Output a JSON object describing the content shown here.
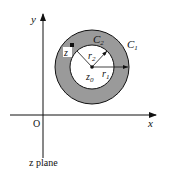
{
  "diagram": {
    "caption": "z plane",
    "axes": {
      "x_label": "x",
      "y_label": "y",
      "origin_label": "O"
    },
    "annulus": {
      "outer_contour": {
        "label": "C",
        "subscript": "1"
      },
      "inner_contour": {
        "label": "C",
        "subscript": "2"
      },
      "center": {
        "label": "z",
        "subscript": "0"
      },
      "outer_radius": {
        "label": "r",
        "subscript": "1"
      },
      "inner_radius": {
        "label": "r",
        "subscript": "2"
      },
      "point": {
        "label": "z"
      },
      "fill_color": "#9a9a9a",
      "stroke_color": "#111111"
    }
  }
}
